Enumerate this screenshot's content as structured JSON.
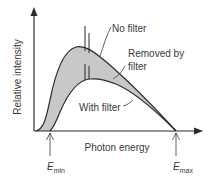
{
  "diagram": {
    "y_axis_label": "Relative intensity",
    "x_axis_label": "Photon energy",
    "labels": {
      "no_filter": "No filter",
      "removed_line1": "Removed by",
      "removed_line2": "filter",
      "with_filter": "With filter"
    },
    "markers": {
      "emin_main": "E",
      "emin_sub": "min",
      "emax_main": "E",
      "emax_sub": "max"
    },
    "colors": {
      "line": "#2b2b2b",
      "shaded_region": "#c8c8c8",
      "text": "#3a3a3a"
    }
  }
}
